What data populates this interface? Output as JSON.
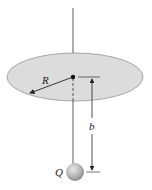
{
  "figure": {
    "labels": {
      "radius": "R",
      "distance": "b",
      "charge": "Q"
    },
    "colors": {
      "disk_fill": "#dcdcdc",
      "disk_stroke": "#8a8a8a",
      "line": "#333333",
      "sphere": "#b5b5b5"
    },
    "elements": [
      "vertical axis line",
      "charged disk (ellipse)",
      "center point",
      "radius arrow R",
      "distance dimension b",
      "point charge sphere Q"
    ]
  }
}
